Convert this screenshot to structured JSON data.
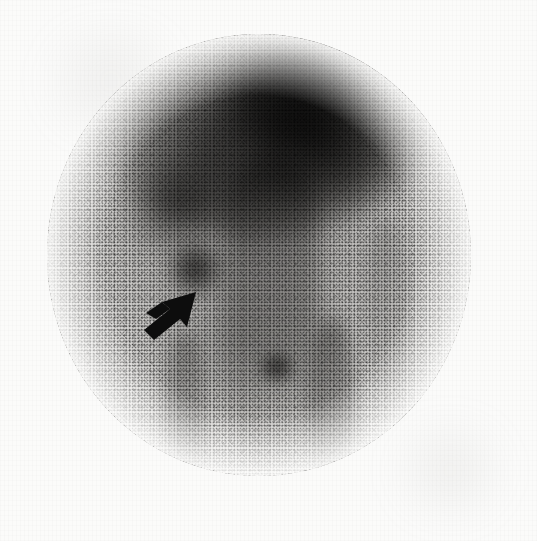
{
  "figure": {
    "modality": "Nuclear medicine gamma camera scan",
    "view": "Anterior abdominal view",
    "caption": "",
    "background_color": "#fbfbfa",
    "field_of_view": {
      "shape": "circle",
      "center_x": 259,
      "center_y": 255,
      "width": 424,
      "height": 442
    }
  },
  "image_content": {
    "regions": [
      {
        "id": "liver-uptake",
        "label": "Diffuse intense uptake, upper abdomen (hepatic region)",
        "intensity": "high",
        "color": "#262524"
      },
      {
        "id": "liver-dome",
        "label": "Dome of intense uptake at superior field margin",
        "intensity": "very-high",
        "color": "#1a1919"
      },
      {
        "id": "right-lobe-extension",
        "label": "Lateral extension of uptake, patient left upper quadrant",
        "intensity": "moderate-high",
        "color": "#282726"
      },
      {
        "id": "splenic-flexure-uptake",
        "label": "Uptake focus, patient right upper quadrant",
        "intensity": "moderate",
        "color": "#302f2e"
      },
      {
        "id": "spine-column",
        "label": "Midline vertebral column activity",
        "intensity": "moderate",
        "color": "#3c3b3a"
      },
      {
        "id": "focal-lesion",
        "label": "Focal abnormal uptake (arrow)",
        "intensity": "high",
        "color": "#222120"
      },
      {
        "id": "secondary-focus",
        "label": "Small focal uptake, lower midline",
        "intensity": "moderate-high",
        "color": "#282726"
      },
      {
        "id": "stripe-left",
        "label": "Paravertebral bone stripe, patient right",
        "intensity": "low-moderate",
        "color": "#605f5d"
      },
      {
        "id": "stripe-right",
        "label": "Paravertebral bone stripe, patient left",
        "intensity": "moderate",
        "color": "#56554f"
      },
      {
        "id": "stripe-far-right",
        "label": "Lateral soft tissue stripe",
        "intensity": "low",
        "color": "#6e6d6b"
      },
      {
        "id": "pelvic-haze",
        "label": "Diffuse low-grade background activity, lower abdomen",
        "intensity": "low",
        "color": "#787775"
      }
    ],
    "annotations": [
      {
        "id": "lesion-arrow",
        "type": "arrow",
        "color": "#0d0d0d",
        "direction": "up-right",
        "tip_x": 196,
        "tip_y": 294,
        "tail_x": 140,
        "tail_y": 336,
        "points_to": "Focal abnormal uptake"
      }
    ]
  }
}
